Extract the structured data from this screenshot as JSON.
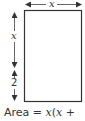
{
  "diagram": {
    "type": "rectangle-dimension-figure",
    "shape": "rectangle",
    "colors": {
      "stroke": "#333333",
      "background": "#ffffff"
    },
    "top_dimension": {
      "label": "x",
      "direction": "horizontal"
    },
    "left_dimensions": [
      {
        "label": "x",
        "direction": "vertical"
      },
      {
        "label": "2",
        "direction": "vertical"
      }
    ],
    "caption": {
      "prefix": "Area = ",
      "var1": "x",
      "paren_open": "(",
      "var2": "x",
      "suffix": " +"
    }
  }
}
